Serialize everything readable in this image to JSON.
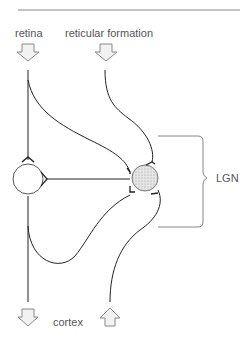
{
  "diagram": {
    "labels": {
      "retina": "retina",
      "reticular": "reticular formation",
      "lgn": "LGN",
      "cortex": "cortex"
    },
    "colors": {
      "line": "#222222",
      "rule": "#888888",
      "arrow_fill": "#f2f2f2",
      "arrow_stroke": "#888888",
      "nucleus_fill": "#dddddd"
    }
  }
}
